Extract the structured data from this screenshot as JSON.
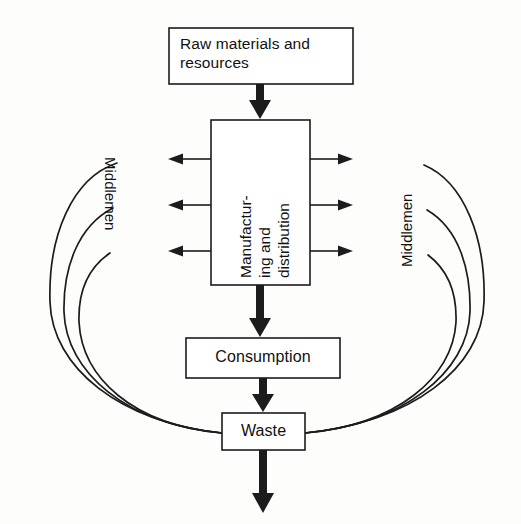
{
  "diagram": {
    "background_color": "#fdfdfc",
    "ink_color": "#1c1c1c",
    "boxes": [
      {
        "id": "raw_materials",
        "label": "Raw materials and\nresources",
        "x": 169,
        "y": 28,
        "width": 184,
        "height": 56
      },
      {
        "id": "manufacturing",
        "label": "Manufactur-\ning and\ndistribution",
        "x": 211,
        "y": 120,
        "width": 99,
        "height": 165,
        "text_orientation": "vertical-bottom-to-top"
      },
      {
        "id": "consumption",
        "label": "Consumption",
        "x": 186,
        "y": 338,
        "width": 154,
        "height": 40
      },
      {
        "id": "waste",
        "label": "Waste",
        "x": 222,
        "y": 413,
        "width": 83,
        "height": 37
      }
    ],
    "side_labels": [
      {
        "id": "middlemen_left",
        "label": "Middlemen",
        "orientation": "vertical-top-to-bottom"
      },
      {
        "id": "middlemen_right",
        "label": "Middlemen",
        "orientation": "vertical-bottom-to-top"
      }
    ],
    "flows": [
      {
        "id": "raw_to_manufacturing",
        "from": "raw_materials",
        "to": "manufacturing",
        "style": "thick-arrow",
        "direction": "down"
      },
      {
        "id": "manufacturing_to_consumption",
        "from": "manufacturing",
        "to": "consumption",
        "style": "thick-arrow",
        "direction": "down"
      },
      {
        "id": "consumption_to_waste",
        "from": "consumption",
        "to": "waste",
        "style": "thick-arrow",
        "direction": "down"
      },
      {
        "id": "waste_out",
        "from": "waste",
        "to": "environment",
        "style": "thick-arrow",
        "direction": "down"
      },
      {
        "id": "manufacturing_to_middlemen_left_1",
        "from": "manufacturing",
        "to": "middlemen_left",
        "style": "thin-arrow",
        "direction": "left"
      },
      {
        "id": "manufacturing_to_middlemen_left_2",
        "from": "manufacturing",
        "to": "middlemen_left",
        "style": "thin-arrow",
        "direction": "left"
      },
      {
        "id": "manufacturing_to_middlemen_left_3",
        "from": "manufacturing",
        "to": "middlemen_left",
        "style": "thin-arrow",
        "direction": "left"
      },
      {
        "id": "manufacturing_to_middlemen_right_1",
        "from": "manufacturing",
        "to": "middlemen_right",
        "style": "thin-arrow",
        "direction": "right"
      },
      {
        "id": "manufacturing_to_middlemen_right_2",
        "from": "manufacturing",
        "to": "middlemen_right",
        "style": "thin-arrow",
        "direction": "right"
      },
      {
        "id": "manufacturing_to_middlemen_right_3",
        "from": "manufacturing",
        "to": "middlemen_right",
        "style": "thin-arrow",
        "direction": "right"
      },
      {
        "id": "middlemen_left_curve_1",
        "from": "middlemen_left",
        "to": "waste",
        "style": "curve"
      },
      {
        "id": "middlemen_left_curve_2",
        "from": "middlemen_left",
        "to": "waste",
        "style": "curve"
      },
      {
        "id": "middlemen_left_curve_3",
        "from": "middlemen_left",
        "to": "waste",
        "style": "curve"
      },
      {
        "id": "middlemen_right_curve_1",
        "from": "middlemen_right",
        "to": "waste",
        "style": "curve"
      },
      {
        "id": "middlemen_right_curve_2",
        "from": "middlemen_right",
        "to": "waste",
        "style": "curve"
      },
      {
        "id": "middlemen_right_curve_3",
        "from": "middlemen_right",
        "to": "waste",
        "style": "curve"
      }
    ]
  }
}
